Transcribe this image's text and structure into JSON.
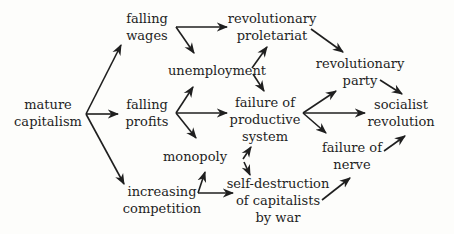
{
  "diagram": {
    "nodes": {
      "mature_capitalism": {
        "lines": [
          "mature",
          "capitalism"
        ],
        "x": 48,
        "y": 96
      },
      "falling_wages": {
        "lines": [
          "falling",
          "wages"
        ],
        "x": 147,
        "y": 10
      },
      "falling_profits": {
        "lines": [
          "falling",
          "profits"
        ],
        "x": 147,
        "y": 96
      },
      "increasing_competition": {
        "lines": [
          "increasing",
          "competition"
        ],
        "x": 162,
        "y": 183
      },
      "unemployment": {
        "lines": [
          "unemployment"
        ],
        "x": 217,
        "y": 62
      },
      "monopoly": {
        "lines": [
          "monopoly"
        ],
        "x": 195,
        "y": 148
      },
      "revolutionary_proletariat": {
        "lines": [
          "revolutionary",
          "proletariat"
        ],
        "x": 272,
        "y": 10
      },
      "failure_productive_system": {
        "lines": [
          "failure of",
          "productive",
          "system"
        ],
        "x": 265,
        "y": 94
      },
      "self_destruction": {
        "lines": [
          "self-destruction",
          "of capitalists",
          "by war"
        ],
        "x": 278,
        "y": 175
      },
      "revolutionary_party": {
        "lines": [
          "revolutionary",
          "party"
        ],
        "x": 360,
        "y": 55
      },
      "failure_of_nerve": {
        "lines": [
          "failure of",
          "nerve"
        ],
        "x": 352,
        "y": 139
      },
      "socialist_revolution": {
        "lines": [
          "socialist",
          "revolution"
        ],
        "x": 401,
        "y": 96
      }
    },
    "arrows": [
      {
        "from": "mature_capitalism",
        "to": "falling_wages",
        "x1": 86,
        "y1": 114,
        "x2": 121,
        "y2": 45
      },
      {
        "from": "mature_capitalism",
        "to": "falling_profits",
        "x1": 86,
        "y1": 114,
        "x2": 118,
        "y2": 114
      },
      {
        "from": "mature_capitalism",
        "to": "increasing_competition",
        "x1": 86,
        "y1": 114,
        "x2": 124,
        "y2": 184
      },
      {
        "from": "falling_wages",
        "to": "revolutionary_proletariat",
        "x1": 176,
        "y1": 27,
        "x2": 227,
        "y2": 27
      },
      {
        "from": "falling_wages",
        "to": "unemployment",
        "x1": 176,
        "y1": 27,
        "x2": 194,
        "y2": 53
      },
      {
        "from": "falling_profits",
        "to": "unemployment",
        "x1": 176,
        "y1": 113,
        "x2": 193,
        "y2": 87
      },
      {
        "from": "falling_profits",
        "to": "failure_productive_system",
        "x1": 176,
        "y1": 113,
        "x2": 227,
        "y2": 113
      },
      {
        "from": "falling_profits",
        "to": "monopoly",
        "x1": 176,
        "y1": 113,
        "x2": 196,
        "y2": 138
      },
      {
        "from": "unemployment",
        "to": "revolutionary_proletariat",
        "x1": 252,
        "y1": 68,
        "x2": 267,
        "y2": 47
      },
      {
        "from": "unemployment",
        "to": "failure_productive_system",
        "x1": 253,
        "y1": 74,
        "x2": 264,
        "y2": 91
      },
      {
        "from": "increasing_competition",
        "to": "monopoly",
        "x1": 198,
        "y1": 193,
        "x2": 205,
        "y2": 172
      },
      {
        "from": "increasing_competition",
        "to": "self_destruction",
        "x1": 198,
        "y1": 193,
        "x2": 233,
        "y2": 193
      },
      {
        "from": "self_destruction",
        "to": "failure_productive_system",
        "x1": 243,
        "y1": 159,
        "x2": 251,
        "y2": 147
      },
      {
        "from": "failure_productive_system",
        "to": "self_destruction",
        "x1": 244,
        "y1": 162,
        "x2": 250,
        "y2": 175
      },
      {
        "from": "revolutionary_proletariat",
        "to": "revolutionary_party",
        "x1": 311,
        "y1": 29,
        "x2": 343,
        "y2": 52
      },
      {
        "from": "failure_productive_system",
        "to": "revolutionary_party",
        "x1": 303,
        "y1": 113,
        "x2": 336,
        "y2": 91
      },
      {
        "from": "failure_productive_system",
        "to": "socialist_revolution",
        "x1": 303,
        "y1": 113,
        "x2": 365,
        "y2": 113
      },
      {
        "from": "failure_productive_system",
        "to": "failure_of_nerve",
        "x1": 303,
        "y1": 113,
        "x2": 326,
        "y2": 133
      },
      {
        "from": "revolutionary_party",
        "to": "socialist_revolution",
        "x1": 380,
        "y1": 80,
        "x2": 402,
        "y2": 94
      },
      {
        "from": "failure_of_nerve",
        "to": "socialist_revolution",
        "x1": 384,
        "y1": 151,
        "x2": 405,
        "y2": 136
      },
      {
        "from": "self_destruction",
        "to": "failure_of_nerve",
        "x1": 322,
        "y1": 200,
        "x2": 350,
        "y2": 178
      }
    ]
  }
}
